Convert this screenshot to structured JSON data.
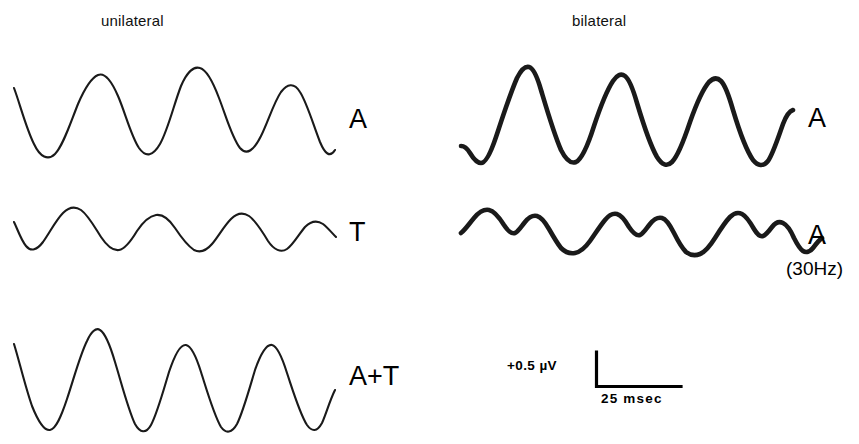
{
  "figure": {
    "background_color": "#ffffff",
    "stroke_color": "#1a1a1a"
  },
  "columns": {
    "left_header": "unilateral",
    "right_header": "bilateral"
  },
  "traces": [
    {
      "id": "unilateral-a",
      "column": "unilateral",
      "label": "A",
      "sublabel": "",
      "stroke": "thin",
      "cycles": 4,
      "description": "smooth sinusoid, large amplitude"
    },
    {
      "id": "unilateral-t",
      "column": "unilateral",
      "label": "T",
      "sublabel": "",
      "stroke": "thin",
      "cycles": 4,
      "description": "smooth sinusoid, small amplitude"
    },
    {
      "id": "unilateral-a-plus-t",
      "column": "unilateral",
      "label": "A+T",
      "sublabel": "",
      "stroke": "thin",
      "cycles": 4,
      "description": "peaked sinusoid, large amplitude"
    },
    {
      "id": "bilateral-a",
      "column": "bilateral",
      "label": "A",
      "sublabel": "",
      "stroke": "thick",
      "cycles": 4,
      "description": "sharp peaked waveform, large amplitude"
    },
    {
      "id": "bilateral-a-30hz",
      "column": "bilateral",
      "label": "A",
      "sublabel": "(30Hz)",
      "stroke": "thick",
      "cycles": 3,
      "description": "low amplitude waveform with doubled sub-peaks"
    }
  ],
  "scale_bar": {
    "voltage_label": "+0.5 µV",
    "time_label": "25 msec"
  },
  "chart_data": {
    "type": "line",
    "title": "",
    "xlabel": "time",
    "ylabel": "amplitude",
    "annotations": [
      "unilateral",
      "bilateral",
      "+0.5 µV",
      "25 msec",
      "(30Hz)"
    ],
    "scale": {
      "voltage": "+0.5 µV",
      "time": "25 msec"
    },
    "grid": false,
    "legend": "none",
    "series": [
      {
        "name": "unilateral A",
        "panel": "unilateral",
        "label": "A",
        "path": "M 14,88 C 20,104 26,128 34,144 C 40,157 48,161 55,154 C 63,146 70,124 78,104 C 84,90 91,78 98,75 C 105,72 112,82 118,96 C 125,112 131,136 139,148 C 146,158 153,156 160,144 C 168,130 174,104 181,86 C 187,72 194,66 200,68 C 207,70 213,82 219,98 C 226,116 232,138 240,148 C 247,156 254,150 261,136 C 268,122 274,102 281,92 C 287,84 294,82 300,92 C 307,103 313,124 320,142 C 325,154 330,158 335,150"
      },
      {
        "name": "unilateral T",
        "panel": "unilateral",
        "label": "T",
        "path": "M 14,222 C 17,228 21,240 26,246 C 31,252 37,250 43,242 C 50,232 56,220 63,213 C 69,207 75,206 81,210 C 88,215 94,226 101,237 C 107,246 113,251 119,250 C 125,249 131,241 137,231 C 143,222 150,216 156,215 C 163,214 169,219 175,228 C 181,237 188,246 194,250 C 200,253 206,251 212,244 C 218,237 224,226 231,219 C 237,213 243,212 249,216 C 256,221 262,231 268,241 C 274,250 281,253 287,249 C 293,245 299,234 305,227 C 311,221 317,220 323,224 C 328,228 332,233 336,237"
      },
      {
        "name": "unilateral A+T",
        "panel": "unilateral",
        "label": "A+T",
        "path": "M 14,344 C 19,360 25,386 32,406 C 38,421 44,431 50,430 C 56,429 61,417 67,399 C 74,378 80,355 87,341 C 91,332 96,327 100,330 C 105,333 110,345 115,362 C 122,385 128,409 135,424 C 140,433 146,434 151,425 C 157,414 163,392 169,372 C 175,354 181,344 186,345 C 191,346 196,356 201,372 C 208,394 214,415 221,427 C 226,434 232,433 237,424 C 243,412 249,390 255,370 C 261,353 267,344 272,345 C 277,346 282,357 287,373 C 294,394 300,414 307,425 C 312,432 317,432 322,423 C 326,414 330,400 335,390"
      },
      {
        "name": "bilateral A",
        "panel": "bilateral",
        "label": "A",
        "path": "M 461,146 C 464,146 467,148 470,153 C 473,158 477,163 481,163 C 486,163 491,152 496,137 C 503,116 510,94 517,78 C 521,70 525,66 529,67 C 533,68 537,76 541,90 C 547,110 554,134 561,150 C 566,160 571,164 576,162 C 582,159 588,145 594,126 C 600,108 607,90 613,81 C 617,75 621,73 625,76 C 629,79 633,89 637,103 C 643,123 650,145 657,157 C 662,165 667,167 672,162 C 678,156 684,140 690,122 C 696,105 703,89 709,82 C 713,78 717,77 721,81 C 725,85 729,96 733,110 C 739,130 746,150 753,160 C 758,166 763,167 768,161 C 773,154 778,138 783,124 C 786,116 790,111 793,110"
      },
      {
        "name": "bilateral A (30Hz)",
        "panel": "bilateral",
        "label": "A",
        "sublabel": "(30Hz)",
        "path": "M 461,233 C 465,230 469,224 474,218 C 479,212 484,209 489,210 C 494,211 499,217 504,225 C 508,231 512,234 515,233 C 518,232 521,227 525,222 C 529,217 533,215 537,216 C 541,217 545,222 549,229 C 553,236 557,243 561,248 C 565,252 570,254 575,253 C 580,252 585,248 590,241 C 595,234 600,226 605,220 C 609,215 613,213 617,214 C 621,215 625,220 629,227 C 633,233 637,236 640,235 C 643,234 646,229 650,224 C 654,219 658,217 662,218 C 666,219 670,225 674,233 C 678,241 682,248 686,252 C 690,255 695,256 700,254 C 705,252 710,246 715,238 C 720,230 725,222 730,217 C 734,213 738,212 742,214 C 746,216 750,222 754,229 C 757,234 760,237 763,236 C 766,235 769,231 772,227 C 775,223 779,221 783,223 C 787,225 791,231 794,238 C 797,244 800,249 803,251 C 806,253 810,252 813,248 C 816,244 819,240 822,238"
      }
    ]
  }
}
